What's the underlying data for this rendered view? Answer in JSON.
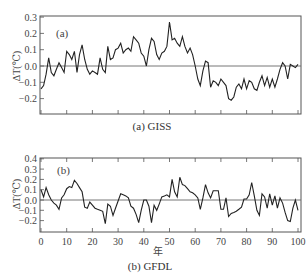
{
  "chart_data": [
    {
      "type": "line",
      "panel_label": "(a)",
      "caption": "(a)  GISS",
      "title": "GISS",
      "xlabel": "",
      "ylabel": "ΔT(℃)",
      "ylim": [
        -0.3,
        0.3
      ],
      "xlim": [
        0,
        100
      ],
      "yticks": [
        "0.3",
        "0.2",
        "0.1",
        "0.0",
        "-0.1",
        "-0.2"
      ],
      "xticks_shown": false,
      "zero_line": true,
      "grid": false,
      "x": [
        0,
        1,
        2,
        3,
        4,
        5,
        6,
        7,
        8,
        9,
        10,
        11,
        12,
        13,
        14,
        15,
        16,
        17,
        18,
        19,
        20,
        21,
        22,
        23,
        24,
        25,
        26,
        27,
        28,
        29,
        30,
        31,
        32,
        33,
        34,
        35,
        36,
        37,
        38,
        39,
        40,
        41,
        42,
        43,
        44,
        45,
        46,
        47,
        48,
        49,
        50,
        51,
        52,
        53,
        54,
        55,
        56,
        57,
        58,
        59,
        60,
        61,
        62,
        63,
        64,
        65,
        66,
        67,
        68,
        69,
        70,
        71,
        72,
        73,
        74,
        75,
        76,
        77,
        78,
        79,
        80,
        81,
        82,
        83,
        84,
        85,
        86,
        87,
        88,
        89,
        90,
        91,
        92,
        93,
        94,
        95,
        96,
        97,
        98,
        99,
        100
      ],
      "values": [
        -0.14,
        -0.12,
        -0.05,
        0.05,
        -0.04,
        -0.06,
        -0.02,
        0.02,
        -0.01,
        -0.04,
        0.09,
        0.07,
        0.04,
        0.09,
        -0.04,
        0.07,
        0.13,
        0.04,
        -0.02,
        -0.05,
        -0.03,
        -0.04,
        -0.05,
        0.05,
        -0.02,
        -0.04,
        0.12,
        0.04,
        0.05,
        0.1,
        0.11,
        0.14,
        0.08,
        0.1,
        0.11,
        0.09,
        0.18,
        0.16,
        0.14,
        0.08,
        0.06,
        0.0,
        0.1,
        0.17,
        0.15,
        0.07,
        0.04,
        0.08,
        0.09,
        0.12,
        0.27,
        0.16,
        0.17,
        0.14,
        0.12,
        0.18,
        0.12,
        0.08,
        0.11,
        0.07,
        0.0,
        -0.08,
        -0.12,
        -0.03,
        0.03,
        0.02,
        -0.13,
        -0.09,
        -0.1,
        -0.12,
        -0.08,
        -0.1,
        -0.12,
        -0.2,
        -0.21,
        -0.19,
        -0.13,
        -0.11,
        -0.14,
        -0.08,
        -0.14,
        -0.09,
        -0.1,
        -0.14,
        -0.15,
        -0.1,
        -0.06,
        -0.12,
        -0.07,
        -0.13,
        -0.08,
        -0.13,
        -0.08,
        -0.02,
        0.02,
        0.0,
        -0.08,
        0.01,
        0.0,
        -0.01,
        0.01
      ]
    },
    {
      "type": "line",
      "panel_label": "(b)",
      "caption": "(b)  GFDL",
      "title": "GFDL",
      "xlabel": "年",
      "ylabel": "ΔT(℃)",
      "ylim": [
        -0.3,
        0.4
      ],
      "xlim": [
        0,
        100
      ],
      "yticks": [
        "0.4",
        "0.3",
        "0.2",
        "0.1",
        "0.0",
        "-0.1",
        "-0.2"
      ],
      "xticks": [
        "0",
        "10",
        "20",
        "30",
        "40",
        "50",
        "60",
        "70",
        "80",
        "90",
        "100"
      ],
      "zero_line": true,
      "grid": false,
      "x": [
        0,
        1,
        2,
        3,
        4,
        5,
        6,
        7,
        8,
        9,
        10,
        11,
        12,
        13,
        14,
        15,
        16,
        17,
        18,
        19,
        20,
        21,
        22,
        23,
        24,
        25,
        26,
        27,
        28,
        29,
        30,
        31,
        32,
        33,
        34,
        35,
        36,
        37,
        38,
        39,
        40,
        41,
        42,
        43,
        44,
        45,
        46,
        47,
        48,
        49,
        50,
        51,
        52,
        53,
        54,
        55,
        56,
        57,
        58,
        59,
        60,
        61,
        62,
        63,
        64,
        65,
        66,
        67,
        68,
        69,
        70,
        71,
        72,
        73,
        74,
        75,
        76,
        77,
        78,
        79,
        80,
        81,
        82,
        83,
        84,
        85,
        86,
        87,
        88,
        89,
        90,
        91,
        92,
        93,
        94,
        95,
        96,
        97,
        98,
        99,
        100
      ],
      "values": [
        0.1,
        0.03,
        0.12,
        0.05,
        0.0,
        -0.03,
        -0.05,
        -0.09,
        0.02,
        0.05,
        0.11,
        0.13,
        0.12,
        0.19,
        0.16,
        0.12,
        0.08,
        -0.07,
        -0.08,
        -0.02,
        -0.05,
        -0.08,
        -0.09,
        -0.1,
        -0.11,
        -0.23,
        -0.04,
        -0.06,
        -0.15,
        -0.08,
        -0.01,
        0.06,
        0.05,
        0.04,
        0.02,
        -0.06,
        -0.08,
        -0.14,
        -0.22,
        -0.1,
        0.0,
        0.0,
        -0.06,
        -0.22,
        -0.05,
        -0.1,
        -0.04,
        0.03,
        0.04,
        0.05,
        0.03,
        0.2,
        0.08,
        0.03,
        0.22,
        0.15,
        0.14,
        0.11,
        0.08,
        0.07,
        0.05,
        0.02,
        -0.09,
        0.02,
        0.15,
        0.07,
        0.02,
        0.09,
        0.09,
        0.09,
        -0.09,
        -0.09,
        0.02,
        -0.16,
        -0.13,
        -0.12,
        -0.11,
        -0.09,
        -0.07,
        0.01,
        0.01,
        0.05,
        0.17,
        0.04,
        -0.1,
        -0.15,
        0.06,
        0.03,
        -0.08,
        0.06,
        -0.05,
        0.04,
        -0.08,
        0.02,
        -0.03,
        -0.12,
        -0.2,
        -0.21,
        -0.08,
        0.0,
        -0.1
      ]
    }
  ]
}
